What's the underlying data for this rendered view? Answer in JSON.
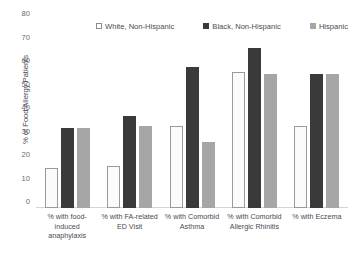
{
  "chart_data": {
    "type": "bar",
    "title": "",
    "xlabel": "",
    "ylabel": "% of Food Allergy Patients",
    "ylim": [
      0,
      80
    ],
    "ytick_labels": [
      "80",
      "70",
      "60",
      "50",
      "40",
      "30",
      "20",
      "10",
      "0"
    ],
    "ytick_values": [
      80,
      70,
      60,
      50,
      40,
      30,
      20,
      10,
      0
    ],
    "grid": false,
    "legend_position": "top",
    "categories": [
      "% with food-induced anaphylaxis",
      "% with FA-related ED Visit",
      "% with Comorbid Asthma",
      "% with Comorbid Allergic Rhinitis",
      "% with Eczema"
    ],
    "category_lines": [
      [
        "% with food-",
        "induced",
        "anaphylaxis"
      ],
      [
        "% with FA-related",
        "ED Visit"
      ],
      [
        "% with Comorbid",
        "Asthma"
      ],
      [
        "% with Comorbid",
        "Allergic Rhinitis"
      ],
      [
        "% with Eczema"
      ]
    ],
    "series": [
      {
        "name": "White, Non-Hispanic",
        "color": "#ffffff",
        "values": [
          17,
          18,
          35,
          58,
          35
        ]
      },
      {
        "name": "Black, Non-Hispanic",
        "color": "#3a3a3a",
        "values": [
          34,
          39,
          60,
          68,
          57
        ]
      },
      {
        "name": "Hispanic",
        "color": "#a6a6a6",
        "values": [
          34,
          35,
          28,
          57,
          57
        ]
      }
    ]
  },
  "legend": {
    "items": [
      {
        "label": "White, Non-Hispanic",
        "swatch": "white-square-icon"
      },
      {
        "label": "Black, Non-Hispanic",
        "swatch": "black-square-icon"
      },
      {
        "label": "Hispanic",
        "swatch": "gray-square-icon"
      }
    ]
  },
  "axes": {
    "y_title": "% of Food Allergy Patients"
  },
  "colors": {
    "white_series": "#ffffff",
    "black_series": "#3a3a3a",
    "gray_series": "#a6a6a6",
    "axis": "#d4d4d4",
    "text": "#4a4a52"
  }
}
